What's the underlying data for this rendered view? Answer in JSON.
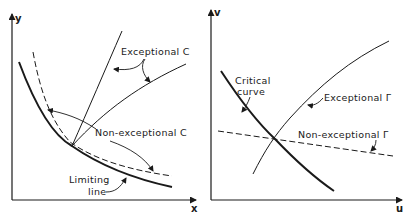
{
  "left_panel": {
    "x_axis_label": "x",
    "y_axis_label": "y",
    "labels": {
      "exceptional": "Exceptional C",
      "non_exceptional": "Non-exceptional C",
      "limiting_line_1": "Limiting",
      "limiting_line_2": "line"
    },
    "curves": [
      {
        "name": "limiting-line",
        "style": "solid-thick"
      },
      {
        "name": "non-exceptional-c-dashed",
        "style": "dashed"
      },
      {
        "name": "exceptional-c-steep",
        "style": "solid-thin"
      },
      {
        "name": "exceptional-c-shallow",
        "style": "solid-thin"
      }
    ]
  },
  "right_panel": {
    "x_axis_label": "u",
    "y_axis_label": "v",
    "labels": {
      "critical_1": "Critical",
      "critical_2": "curve",
      "exceptional": "Exceptional Γ",
      "non_exceptional": "Non-exceptional Γ"
    },
    "curves": [
      {
        "name": "critical-curve",
        "style": "solid-thick"
      },
      {
        "name": "exceptional-gamma",
        "style": "solid-thin"
      },
      {
        "name": "non-exceptional-gamma",
        "style": "dashed"
      }
    ]
  },
  "colors": {
    "ink": "#1a1a1a",
    "background": "#ffffff"
  }
}
